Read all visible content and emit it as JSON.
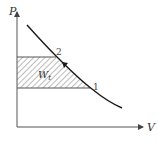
{
  "diagram": {
    "type": "P-V diagram",
    "y_axis_label": "P",
    "x_axis_label": "V",
    "point_2_label": "2",
    "point_1_label": "1",
    "area_label": "W",
    "area_label_sub": "t",
    "colors": {
      "line": "#1a1a1a",
      "axis": "#555555",
      "hatch": "#555555"
    }
  }
}
